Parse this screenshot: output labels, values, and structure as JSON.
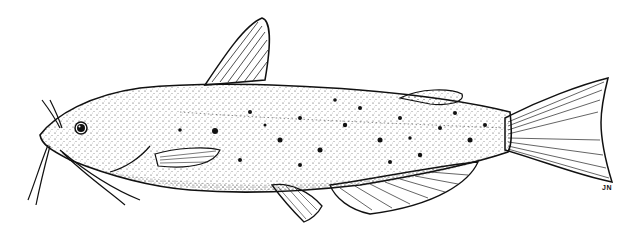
{
  "illustration": {
    "subject": "catfish stipple drawing",
    "signature": "JN",
    "colors": {
      "ink": "#111111",
      "background": "#ffffff"
    }
  }
}
